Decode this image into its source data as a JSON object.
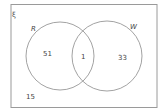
{
  "diagram": {
    "type": "venn",
    "universal_label": "ξ",
    "sets": [
      {
        "name": "R",
        "only_count": "51"
      },
      {
        "name": "W",
        "only_count": "33"
      }
    ],
    "intersection_count": "1",
    "outside_count": "15",
    "colors": {
      "stroke": "#8a8a8a",
      "text": "#444444",
      "background": "#ffffff"
    }
  }
}
